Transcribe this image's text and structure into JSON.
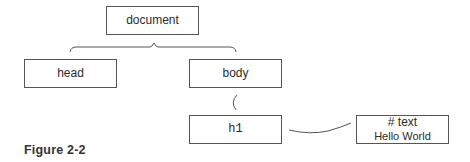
{
  "diagram": {
    "type": "DOM tree",
    "nodes": [
      {
        "id": "document",
        "label": "document"
      },
      {
        "id": "head",
        "label": "head"
      },
      {
        "id": "body",
        "label": "body"
      },
      {
        "id": "h1",
        "label": "h1"
      },
      {
        "id": "text",
        "label": "# text",
        "value": "Hello World"
      }
    ],
    "edges": [
      {
        "from": "document",
        "to": "head"
      },
      {
        "from": "document",
        "to": "body"
      },
      {
        "from": "body",
        "to": "h1"
      },
      {
        "from": "h1",
        "to": "text"
      }
    ],
    "caption": "Figure 2-2"
  },
  "colors": {
    "border": "#555555",
    "text": "#2b2b2b",
    "background": "#ffffff"
  }
}
